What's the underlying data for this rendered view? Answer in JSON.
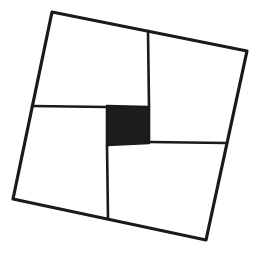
{
  "diagram": {
    "colors": {
      "background": "#ffffff",
      "stroke": "#1a1a1a",
      "center_fill": "#1c1c1c"
    },
    "stroke_width": 2.6,
    "outer_square": {
      "points": [
        [
          52,
          12
        ],
        [
          247,
          51
        ],
        [
          206,
          240
        ],
        [
          13,
          199
        ]
      ]
    },
    "center_square": {
      "points": [
        [
          107,
          106
        ],
        [
          149,
          107
        ],
        [
          149,
          143
        ],
        [
          107,
          145
        ]
      ]
    },
    "divider_lines": [
      {
        "name": "top-divider",
        "from": [
          148,
          31
        ],
        "to": [
          149,
          107
        ]
      },
      {
        "name": "left-divider",
        "from": [
          32,
          106
        ],
        "to": [
          107,
          107
        ]
      },
      {
        "name": "right-divider",
        "from": [
          149,
          142
        ],
        "to": [
          225,
          143
        ]
      },
      {
        "name": "bottom-divider",
        "from": [
          107,
          145
        ],
        "to": [
          108,
          218
        ]
      }
    ],
    "regions": [
      {
        "name": "top-left-rectangle",
        "points": [
          [
            52,
            12
          ],
          [
            148,
            31
          ],
          [
            149,
            107
          ],
          [
            32,
            106
          ]
        ]
      },
      {
        "name": "top-right-rectangle",
        "points": [
          [
            148,
            31
          ],
          [
            247,
            51
          ],
          [
            225,
            143
          ],
          [
            149,
            142
          ]
        ]
      },
      {
        "name": "bottom-right-rectangle",
        "points": [
          [
            107,
            145
          ],
          [
            225,
            143
          ],
          [
            206,
            240
          ],
          [
            108,
            218
          ]
        ]
      },
      {
        "name": "bottom-left-rectangle",
        "points": [
          [
            32,
            106
          ],
          [
            107,
            107
          ],
          [
            108,
            218
          ],
          [
            13,
            199
          ]
        ]
      }
    ]
  }
}
